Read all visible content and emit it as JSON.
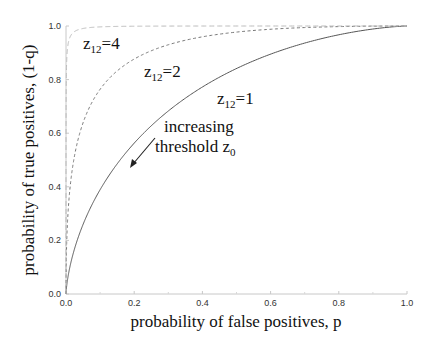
{
  "chart_data": {
    "type": "line",
    "title": "",
    "xlabel": "probability of false positives, p",
    "ylabel": "probability of true positives, (1-q)",
    "xlim": [
      0,
      1
    ],
    "ylim": [
      0,
      1
    ],
    "xticks": [
      "0.0",
      "0.2",
      "0.4",
      "0.6",
      "0.8",
      "1.0"
    ],
    "yticks": [
      "0.0",
      "0.2",
      "0.4",
      "0.6",
      "0.8",
      "1.0"
    ],
    "grid": false,
    "series": [
      {
        "name": "z12=1",
        "z12": 1,
        "style": "solid",
        "color": "#555555",
        "x": [
          0.0,
          0.01,
          0.05,
          0.1,
          0.2,
          0.3,
          0.4,
          0.5,
          0.6,
          0.7,
          0.8,
          0.9,
          1.0
        ],
        "y": [
          0.0,
          0.092,
          0.26,
          0.389,
          0.563,
          0.683,
          0.772,
          0.841,
          0.895,
          0.936,
          0.967,
          0.989,
          1.0
        ]
      },
      {
        "name": "z12=2",
        "z12": 2,
        "style": "dashed",
        "color": "#777777",
        "x": [
          0.0,
          0.01,
          0.05,
          0.1,
          0.2,
          0.3,
          0.5,
          0.7,
          1.0
        ],
        "y": [
          0.0,
          0.372,
          0.639,
          0.764,
          0.877,
          0.93,
          0.977,
          0.994,
          1.0
        ]
      },
      {
        "name": "z12=4",
        "z12": 4,
        "style": "dashed",
        "color": "#bbbbbb",
        "x": [
          0.0,
          0.001,
          0.01,
          0.05,
          0.1,
          1.0
        ],
        "y": [
          0.0,
          0.819,
          0.953,
          0.991,
          0.997,
          1.0
        ]
      }
    ],
    "annotations": [
      {
        "text": "z12=4",
        "x": 0.05,
        "y": 0.9
      },
      {
        "text": "z12=2",
        "x": 0.22,
        "y": 0.79
      },
      {
        "text": "z12=1",
        "x": 0.44,
        "y": 0.69
      },
      {
        "text": "increasing threshold z0",
        "x": 0.29,
        "y": 0.54,
        "arrow_from": [
          0.26,
          0.58
        ],
        "arrow_to": [
          0.19,
          0.48
        ]
      }
    ]
  },
  "labels": {
    "curve_4_main": "z",
    "curve_4_sub": "12",
    "curve_4_val": "=4",
    "curve_2_main": "z",
    "curve_2_sub": "12",
    "curve_2_val": "=2",
    "curve_1_main": "z",
    "curve_1_sub": "12",
    "curve_1_val": "=1",
    "arrow_line1": "increasing",
    "arrow_line2": "threshold z",
    "arrow_line2_sub": "0"
  }
}
